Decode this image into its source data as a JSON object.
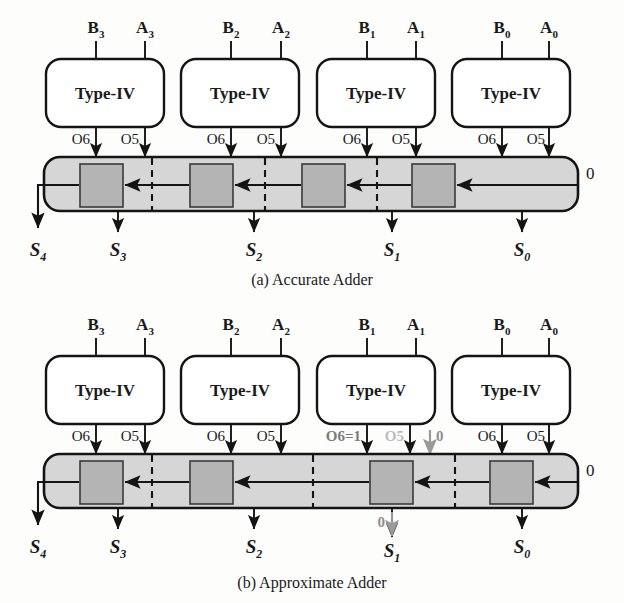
{
  "figure": {
    "colors": {
      "ink": "#141414",
      "chain_fill": "#d6d6d6",
      "mux_fill": "#b4b4b4",
      "annotation_gray": "#7b7b7b",
      "annotation_faint": "#bdbdbd",
      "background": "#fdfdfc"
    }
  },
  "panels": [
    {
      "id": "accurate",
      "caption": "(a) Accurate Adder",
      "carry_in_label": "0",
      "slices": [
        {
          "index": 3,
          "b_label": "B",
          "b_sub": "3",
          "a_label": "A",
          "a_sub": "3",
          "unit_label": "Type-IV",
          "out6_label": "O6",
          "out5_label": "O5",
          "sum_label": "S",
          "sum_sub": "3"
        },
        {
          "index": 2,
          "b_label": "B",
          "b_sub": "2",
          "a_label": "A",
          "a_sub": "2",
          "unit_label": "Type-IV",
          "out6_label": "O6",
          "out5_label": "O5",
          "sum_label": "S",
          "sum_sub": "2"
        },
        {
          "index": 1,
          "b_label": "B",
          "b_sub": "1",
          "a_label": "A",
          "a_sub": "1",
          "unit_label": "Type-IV",
          "out6_label": "O6",
          "out5_label": "O5",
          "sum_label": "S",
          "sum_sub": "1"
        },
        {
          "index": 0,
          "b_label": "B",
          "b_sub": "0",
          "a_label": "A",
          "a_sub": "0",
          "unit_label": "Type-IV",
          "out6_label": "O6",
          "out5_label": "O5",
          "sum_label": "S",
          "sum_sub": "0"
        }
      ],
      "carry_out": {
        "sum_label": "S",
        "sum_sub": "4"
      }
    },
    {
      "id": "approximate",
      "caption": "(b) Approximate Adder",
      "carry_in_label": "0",
      "slices": [
        {
          "index": 3,
          "b_label": "B",
          "b_sub": "3",
          "a_label": "A",
          "a_sub": "3",
          "unit_label": "Type-IV",
          "out6_label": "O6",
          "out5_label": "O5",
          "sum_label": "S",
          "sum_sub": "3"
        },
        {
          "index": 2,
          "b_label": "B",
          "b_sub": "2",
          "a_label": "A",
          "a_sub": "2",
          "unit_label": "Type-IV",
          "out6_label": "O6",
          "out5_label": "O5",
          "sum_label": "S",
          "sum_sub": "2"
        },
        {
          "index": 1,
          "b_label": "B",
          "b_sub": "1",
          "a_label": "A",
          "a_sub": "1",
          "unit_label": "Type-IV",
          "out6_label": "O6=1",
          "out5_label": "O5",
          "sum_label": "S",
          "sum_sub": "1"
        },
        {
          "index": 0,
          "b_label": "B",
          "b_sub": "0",
          "a_label": "A",
          "a_sub": "0",
          "unit_label": "Type-IV",
          "out6_label": "O6",
          "out5_label": "O5",
          "sum_label": "S",
          "sum_sub": "0"
        }
      ],
      "carry_out": {
        "sum_label": "S",
        "sum_sub": "4"
      },
      "annotations": {
        "forced_out6": "O6=1",
        "faded_out5": "O5",
        "injected_zero": "0",
        "sum_zero": "0"
      }
    }
  ]
}
